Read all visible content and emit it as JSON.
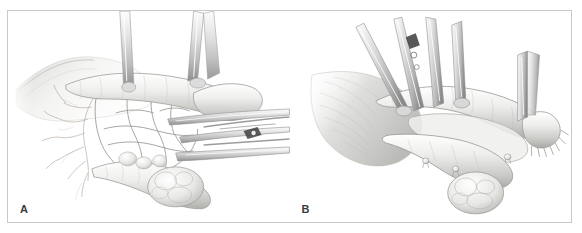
{
  "figure": {
    "panels": [
      {
        "id": "A",
        "label": "A",
        "caption_text": "",
        "description": "Mesentery with vascular arcade exposed, bowel loop retracted by surgical forceps"
      },
      {
        "id": "B",
        "label": "B",
        "caption_text": "",
        "description": "Divided bowel segments with suture knots along cut edges, held by clamps"
      }
    ],
    "colors": {
      "border": "#c9c9c9",
      "background": "#ffffff",
      "ink": "#6f6f6f",
      "ink_dark": "#4a4a4a",
      "tissue_light": "#f2f2f0",
      "tissue_mid": "#d8d8d6",
      "tissue_shadow": "#b4b4b2",
      "vessel": "#a89a90",
      "instrument": "#cfcfcf",
      "label_text": "#3a3a3a"
    }
  }
}
